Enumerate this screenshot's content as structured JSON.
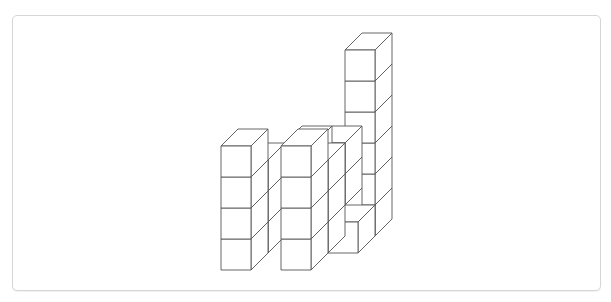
{
  "figure": {
    "header_text_clipped": "",
    "colors": {
      "edge": "#555555",
      "face": "#ffffff",
      "frame_border": "#d6d6d6"
    },
    "cube_geometry": {
      "width": 30,
      "height": 31,
      "depth_dx": 17,
      "depth_dy": -17
    },
    "columns": [
      {
        "row": 2,
        "x": 285,
        "base_y": 236,
        "height": 3
      },
      {
        "row": 2,
        "x": 315,
        "base_y": 236,
        "height": 3
      },
      {
        "row": 2,
        "x": 345,
        "base_y": 236,
        "height": 6
      },
      {
        "row": 1,
        "x": 238,
        "base_y": 253,
        "height": 3
      },
      {
        "row": 1,
        "x": 298,
        "base_y": 253,
        "height": 3
      },
      {
        "row": 1,
        "x": 328,
        "base_y": 253,
        "height": 1
      },
      {
        "row": 0,
        "x": 221,
        "base_y": 270,
        "height": 4
      },
      {
        "row": 0,
        "x": 281,
        "base_y": 270,
        "height": 4
      }
    ],
    "total_cubes": 27
  }
}
